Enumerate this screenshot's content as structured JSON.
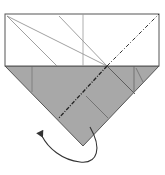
{
  "diagram": {
    "type": "origami-fold-step",
    "colors": {
      "paper_front": "#ffffff",
      "paper_back": "#a9a9a9",
      "line": "#555555",
      "crease": "#7f7f7f",
      "fold_line": "#2a2a2a",
      "arrow": "#333333"
    },
    "elements": [
      {
        "name": "top-flap",
        "shape": "rectangle",
        "fill": "white"
      },
      {
        "name": "bottom-triangle",
        "shape": "triangle",
        "fill": "gray"
      },
      {
        "name": "valley-fold-line",
        "style": "dash-dot"
      },
      {
        "name": "fold-arrow",
        "direction": "counter-clockwise curve to left"
      }
    ]
  }
}
